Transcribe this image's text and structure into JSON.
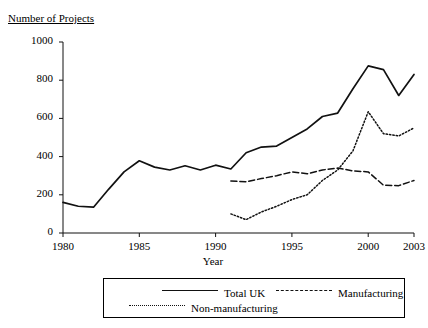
{
  "chart_data": {
    "type": "line",
    "title": "",
    "ylabel": "Number of Projects",
    "xlabel": "Year",
    "ylim": [
      0,
      1000
    ],
    "xlim": [
      1980,
      2003
    ],
    "ytick_labels": [
      "0",
      "200",
      "400",
      "600",
      "800",
      "1000"
    ],
    "ytick_values": [
      0,
      200,
      400,
      600,
      800,
      1000
    ],
    "xtick_labels": [
      "1980",
      "1985",
      "1990",
      "1995",
      "2000",
      "2003"
    ],
    "xtick_values": [
      1980,
      1985,
      1990,
      1995,
      2000,
      2003
    ],
    "grid": false,
    "legend_position": "bottom",
    "series": [
      {
        "name": "Total UK",
        "style": "solid",
        "color": "#111111",
        "x": [
          1980,
          1981,
          1982,
          1983,
          1984,
          1985,
          1986,
          1987,
          1988,
          1989,
          1990,
          1991,
          1992,
          1993,
          1994,
          1995,
          1996,
          1997,
          1998,
          1999,
          2000,
          2001,
          2002,
          2003
        ],
        "values": [
          160,
          140,
          135,
          230,
          320,
          378,
          345,
          330,
          352,
          330,
          355,
          335,
          420,
          450,
          455,
          500,
          545,
          610,
          628,
          755,
          875,
          855,
          720,
          830
        ]
      },
      {
        "name": "Manufacturing",
        "style": "dashed",
        "color": "#111111",
        "x": [
          1991,
          1992,
          1993,
          1994,
          1995,
          1996,
          1997,
          1998,
          1999,
          2000,
          2001,
          2002,
          2003
        ],
        "values": [
          272,
          268,
          285,
          300,
          320,
          310,
          330,
          340,
          325,
          320,
          250,
          248,
          275
        ]
      },
      {
        "name": "Non-manufacturing",
        "style": "dotted",
        "color": "#111111",
        "x": [
          1991,
          1992,
          1993,
          1994,
          1995,
          1996,
          1997,
          1998,
          1999,
          2000,
          2001,
          2002,
          2003
        ],
        "values": [
          100,
          70,
          110,
          140,
          175,
          200,
          275,
          330,
          430,
          635,
          520,
          508,
          550
        ]
      }
    ]
  },
  "legend": {
    "items": [
      {
        "label": "Total UK",
        "style": "solid"
      },
      {
        "label": "Manufacturing",
        "style": "dashed"
      },
      {
        "label": "Non-manufacturing",
        "style": "dotted"
      }
    ]
  }
}
